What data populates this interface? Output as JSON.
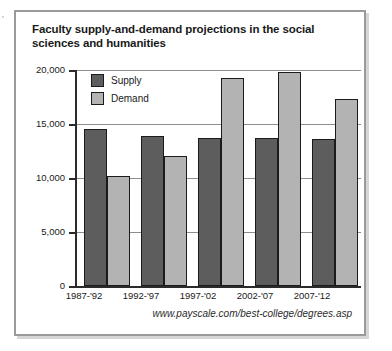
{
  "card": {
    "title": "Faculty supply-and-demand projections in the social sciences and humanities",
    "source": "www.payscale.com/best-college/degrees.asp"
  },
  "legend": {
    "supply_label": "Supply",
    "demand_label": "Demand"
  },
  "colors": {
    "supply": "#5d5d5d",
    "demand": "#b3b3b3",
    "axis": "#2b2b2b",
    "grid": "#8e8e8e",
    "border": "#9a9a9a"
  },
  "chart_data": {
    "type": "bar",
    "title": "Faculty supply-and-demand projections in the social sciences and humanities",
    "xlabel": "",
    "ylabel": "",
    "ylim": [
      0,
      20000
    ],
    "yticks": [
      0,
      5000,
      10000,
      15000,
      20000
    ],
    "ytick_labels": [
      "0",
      "5,000",
      "10,000",
      "15,000",
      "20,000"
    ],
    "grid": true,
    "legend_position": "top-left",
    "categories": [
      "1987-'92",
      "1992-'97",
      "1997-'02",
      "2002-'07",
      "2007-'12"
    ],
    "series": [
      {
        "name": "Supply",
        "values": [
          14500,
          13900,
          13700,
          13700,
          13600
        ]
      },
      {
        "name": "Demand",
        "values": [
          10200,
          12000,
          19300,
          19800,
          17300
        ]
      }
    ],
    "source": "www.payscale.com/best-college/degrees.asp"
  }
}
